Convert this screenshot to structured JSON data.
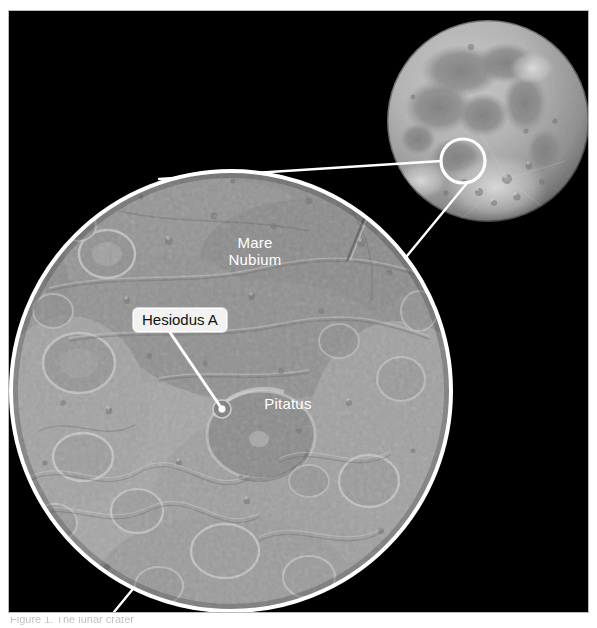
{
  "figure": {
    "background_color": "#ffffff",
    "plate_color": "#000000",
    "border_color": "#b9b9b9",
    "line_color": "#ffffff"
  },
  "globe": {
    "name": "moon-globe",
    "center_x": 479,
    "center_y": 110,
    "radius": 101,
    "highlight_circle": {
      "center_x": 454,
      "center_y": 150,
      "radius": 22
    }
  },
  "magnified_view": {
    "name": "magnified-region",
    "center_x": 222,
    "center_y": 380,
    "radius": 222
  },
  "labels": [
    {
      "id": "mare-nubium",
      "text": "Mare\nNubium",
      "style": "plain-white",
      "x": 246,
      "y": 232
    },
    {
      "id": "pitatus",
      "text": "Pitatus",
      "style": "plain-white",
      "x": 279,
      "y": 393
    },
    {
      "id": "hesiodus-a",
      "text": "Hesiodus A",
      "style": "boxed-dark-on-white",
      "x": 166,
      "y": 306,
      "leader_to_x": 213,
      "leader_to_y": 398
    }
  ],
  "caption": {
    "text": "Figure 1.  The lunar crater",
    "clipped": true
  }
}
